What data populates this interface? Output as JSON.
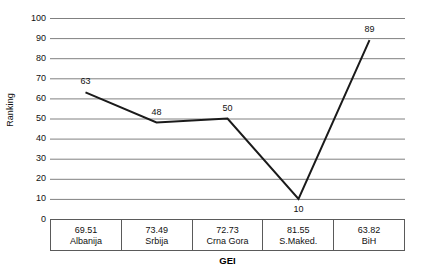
{
  "chart_data": {
    "type": "line",
    "title": "",
    "xlabel": "GEI",
    "ylabel": "Ranking",
    "categories": [
      "Albanija",
      "Srbija",
      "Crna Gora",
      "S.Maked.",
      "BiH"
    ],
    "category_values": [
      "69.51",
      "73.49",
      "72.73",
      "81.55",
      "63.82"
    ],
    "values": [
      63,
      48,
      50,
      10,
      89
    ],
    "point_labels": [
      "63",
      "48",
      "50",
      "10",
      "89"
    ],
    "point_label_positions": [
      "above",
      "above",
      "above",
      "below",
      "above"
    ],
    "ylim": [
      0,
      100
    ],
    "ytick_step": 10,
    "yticks": [
      "100",
      "90",
      "80",
      "70",
      "60",
      "50",
      "40",
      "30",
      "20",
      "10",
      "0"
    ],
    "grid": "horizontal",
    "legend": "none",
    "series": [
      {
        "name": "Ranking",
        "values": [
          63,
          48,
          50,
          10,
          89
        ]
      }
    ],
    "colors": {
      "line": "#1a1a1a",
      "grid": "#808080",
      "axis": "#5a5a5a",
      "text": "#111111",
      "background": "#ffffff"
    }
  }
}
